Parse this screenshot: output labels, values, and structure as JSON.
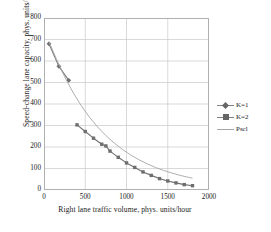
{
  "chart_data": {
    "type": "line",
    "title": "",
    "xlabel": "Right lane traffic volume, phys. units/hour",
    "ylabel": "Speed-change lane capacity, phys. units/hour",
    "xlim": [
      0,
      2000
    ],
    "ylim": [
      0,
      800
    ],
    "xticks": [
      0,
      500,
      1000,
      1500,
      2000
    ],
    "yticks": [
      0,
      100,
      200,
      300,
      400,
      500,
      600,
      700,
      800
    ],
    "grid": true,
    "legend_position": "right",
    "series": [
      {
        "name": "K=1",
        "marker": "diamond",
        "color": "#7a7a7a",
        "x": [
          60,
          180,
          300
        ],
        "y": [
          680,
          575,
          510
        ]
      },
      {
        "name": "K=2",
        "marker": "square",
        "color": "#707070",
        "x": [
          400,
          500,
          600,
          700,
          750,
          800,
          900,
          1000,
          1100,
          1200,
          1300,
          1400,
          1500,
          1600,
          1700,
          1800
        ],
        "y": [
          303,
          272,
          241,
          213,
          205,
          181,
          152,
          126,
          105,
          84,
          68,
          53,
          42,
          33,
          25,
          20
        ]
      },
      {
        "name": "Pscl",
        "marker": "none",
        "color": "#a6a6a6",
        "x": [
          60,
          150,
          250,
          350,
          450,
          550,
          650,
          750,
          850,
          950,
          1050,
          1150,
          1250,
          1350,
          1450,
          1550,
          1650,
          1750,
          1800
        ],
        "y": [
          690,
          610,
          527,
          455,
          393,
          339,
          293,
          253,
          219,
          189,
          163,
          141,
          122,
          105,
          91,
          79,
          68,
          59,
          55
        ]
      }
    ]
  }
}
